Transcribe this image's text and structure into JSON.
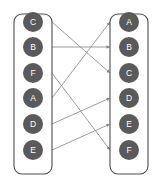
{
  "diagram": {
    "type": "bipartite-mapping",
    "title": "",
    "colors": {
      "background": "#ffffff",
      "node_fill": "#5a5a5a",
      "node_label": "#ffffff",
      "panel_stroke": "#4d4d4d",
      "edge_stroke": "#8a8a8a"
    },
    "left_panel": {
      "name": "source-column",
      "x": 14,
      "y": 14,
      "width": 38,
      "height": 160,
      "radius": 8,
      "nodes": [
        {
          "id": "L0",
          "label": "C",
          "cx": 33,
          "cy": 22,
          "r": 10
        },
        {
          "id": "L1",
          "label": "B",
          "cx": 33,
          "cy": 47,
          "r": 10
        },
        {
          "id": "L2",
          "label": "F",
          "cx": 33,
          "cy": 73,
          "r": 10
        },
        {
          "id": "L3",
          "label": "A",
          "cx": 33,
          "cy": 98,
          "r": 10
        },
        {
          "id": "L4",
          "label": "D",
          "cx": 33,
          "cy": 124,
          "r": 10
        },
        {
          "id": "L5",
          "label": "E",
          "cx": 33,
          "cy": 150,
          "r": 10
        }
      ]
    },
    "right_panel": {
      "name": "target-column",
      "x": 110,
      "y": 14,
      "width": 38,
      "height": 160,
      "radius": 8,
      "nodes": [
        {
          "id": "R0",
          "label": "A",
          "cx": 129,
          "cy": 22,
          "r": 10
        },
        {
          "id": "R1",
          "label": "B",
          "cx": 129,
          "cy": 47,
          "r": 10
        },
        {
          "id": "R2",
          "label": "C",
          "cx": 129,
          "cy": 73,
          "r": 10
        },
        {
          "id": "R3",
          "label": "D",
          "cx": 129,
          "cy": 98,
          "r": 10
        },
        {
          "id": "R4",
          "label": "E",
          "cx": 129,
          "cy": 124,
          "r": 10
        },
        {
          "id": "R5",
          "label": "F",
          "cx": 129,
          "cy": 150,
          "r": 10
        }
      ]
    },
    "edge_geometry": {
      "x_start": 52,
      "x_end": 110,
      "arrow_size": 3.2
    },
    "edges": [
      {
        "from": "L0",
        "to": "R2",
        "from_label": "C",
        "to_label": "C",
        "y1": 22,
        "y2": 73
      },
      {
        "from": "L1",
        "to": "R1",
        "from_label": "B",
        "to_label": "B",
        "y1": 47,
        "y2": 47
      },
      {
        "from": "L2",
        "to": "R5",
        "from_label": "F",
        "to_label": "F",
        "y1": 73,
        "y2": 150
      },
      {
        "from": "L3",
        "to": "R0",
        "from_label": "A",
        "to_label": "A",
        "y1": 98,
        "y2": 22
      },
      {
        "from": "L4",
        "to": "R3",
        "from_label": "D",
        "to_label": "D",
        "y1": 124,
        "y2": 98
      },
      {
        "from": "L5",
        "to": "R4",
        "from_label": "E",
        "to_label": "E",
        "y1": 150,
        "y2": 124
      }
    ]
  }
}
